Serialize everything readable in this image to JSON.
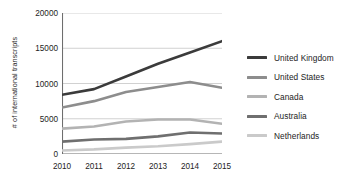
{
  "chart_data": {
    "type": "line",
    "title": "",
    "xlabel": "",
    "ylabel": "# of international transcripts",
    "categories": [
      "2010",
      "2011",
      "2012",
      "2013",
      "2014",
      "2015"
    ],
    "ylim": [
      0,
      20000
    ],
    "yticks": [
      "0",
      "5000",
      "10000",
      "15000",
      "20000"
    ],
    "ytick_values": [
      0,
      5000,
      10000,
      15000,
      20000
    ],
    "grid": true,
    "legend_position": "right",
    "series": [
      {
        "name": "United Kingdom",
        "color": "#3b3b3b",
        "values": [
          8400,
          9200,
          11000,
          12800,
          14400,
          16000
        ]
      },
      {
        "name": "United States",
        "color": "#8d8d8d",
        "values": [
          6600,
          7500,
          8800,
          9500,
          10200,
          9400
        ]
      },
      {
        "name": "Canada",
        "color": "#b3b3b3",
        "values": [
          3600,
          3900,
          4600,
          4900,
          4900,
          4300
        ]
      },
      {
        "name": "Australia",
        "color": "#6f6f6f",
        "values": [
          1750,
          2050,
          2150,
          2500,
          3050,
          2900
        ]
      },
      {
        "name": "Netherlands",
        "color": "#cacaca",
        "values": [
          500,
          650,
          900,
          1100,
          1400,
          1750
        ]
      }
    ]
  },
  "axis": {
    "line_color": "#6e6e6e",
    "grid_color": "#bdbdbd"
  }
}
